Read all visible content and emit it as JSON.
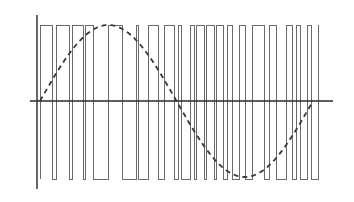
{
  "diagram": {
    "type": "pwm-waveform-with-sine-reference",
    "axes": {
      "vertical": {
        "x": 37,
        "y_top": 15,
        "y_bottom": 189
      },
      "horizontal": {
        "y": 101,
        "x_left": 30,
        "x_right": 333
      }
    },
    "levels": {
      "high": 25,
      "low": 179
    },
    "pwm": {
      "start_level": "high",
      "transitions_x": [
        40,
        52,
        56,
        69,
        72,
        83,
        85,
        93,
        108,
        122,
        136,
        138,
        148,
        158,
        164,
        174,
        178,
        181,
        190,
        194,
        196,
        204,
        206,
        214,
        216,
        223,
        227,
        232,
        239,
        245,
        252,
        264,
        269,
        276,
        286,
        292,
        296,
        300,
        307,
        311,
        318
      ]
    },
    "sine_reference": {
      "style": "dashed",
      "x_start": 40,
      "x_end": 313,
      "center_y": 101,
      "amplitude": 76,
      "cycles": 1
    },
    "colors": {
      "background": "#ffffff",
      "axis": "#2a2a2a",
      "pwm": "#6a6a6a",
      "sine": "#3a3a3a"
    }
  }
}
